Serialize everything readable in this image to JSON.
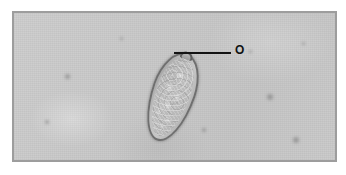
{
  "figure": {
    "kind": "photomicrograph",
    "frame": {
      "border_color": "#9d9d9d",
      "background_color": "#c8c8c8"
    }
  },
  "annotations": [
    {
      "id": "label-o",
      "text": "O",
      "icon": "leader-line",
      "color": "#111111",
      "points_to": "specimen-operculum"
    }
  ],
  "specimen": {
    "name": "egg",
    "outline_color": "#6f6f6f",
    "fill_color": "#bdbdbd",
    "parts": {
      "wall": "shell-wall",
      "contents": "granular-cytoplasm",
      "operculum": "operculum-knob"
    }
  },
  "field": {
    "debris": [
      {
        "x": 63,
        "y": 72,
        "size": 5
      },
      {
        "x": 265,
        "y": 92,
        "size": 6
      },
      {
        "x": 291,
        "y": 135,
        "size": 6
      },
      {
        "x": 43,
        "y": 118,
        "size": 4
      },
      {
        "x": 200,
        "y": 126,
        "size": 4
      },
      {
        "x": 247,
        "y": 48,
        "size": 3
      },
      {
        "x": 118,
        "y": 35,
        "size": 3
      },
      {
        "x": 300,
        "y": 40,
        "size": 3
      }
    ]
  }
}
